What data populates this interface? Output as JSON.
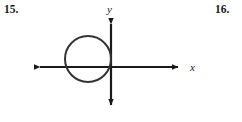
{
  "page": {
    "background_color": "#ffffff",
    "ink_color": "#1a1a1a",
    "width": 242,
    "height": 122
  },
  "problems": {
    "left_number": "15.",
    "right_number": "16."
  },
  "figure": {
    "type": "coordinate-plane-with-circle",
    "axes": {
      "x_axis_label": "x",
      "y_axis_label": "y",
      "origin": {
        "x": 111,
        "y": 67
      },
      "x_axis": {
        "x_start": 33,
        "x_end": 185,
        "y": 67,
        "arrow_both_ends": true
      },
      "y_axis": {
        "y_start": 17,
        "y_end": 112,
        "x": 111,
        "arrow_both_ends": true
      },
      "stroke_width": 2.2
    },
    "circle": {
      "center_x": 88,
      "center_y": 59,
      "radius": 23,
      "stroke_width": 2.0,
      "fill": "none"
    }
  }
}
